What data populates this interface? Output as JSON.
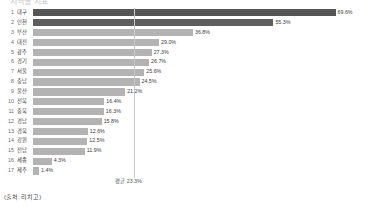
{
  "title": "지역별 지표",
  "source_note": "(출처: 리치고)",
  "average": {
    "label": "평균 23.3%",
    "value": 23.3
  },
  "chart_data": {
    "type": "bar",
    "orientation": "horizontal",
    "title": "지역별 지표",
    "xlabel": "",
    "ylabel": "",
    "xlim": [
      0,
      72
    ],
    "grid": false,
    "legend": "none",
    "average_line": 23.3,
    "average_label": "평균 23.3%",
    "source": "(출처: 리치고)",
    "unit": "%",
    "categories": [
      "대구",
      "인천",
      "부산",
      "대전",
      "광주",
      "경기",
      "서울",
      "충남",
      "울산",
      "전북",
      "충북",
      "경남",
      "경북",
      "강원",
      "전남",
      "세종",
      "제주"
    ],
    "ranks": [
      1,
      2,
      3,
      4,
      5,
      6,
      7,
      8,
      9,
      10,
      11,
      12,
      13,
      14,
      15,
      16,
      17
    ],
    "values": [
      69.6,
      55.3,
      36.8,
      29.0,
      27.3,
      26.7,
      25.6,
      24.5,
      21.2,
      16.4,
      16.3,
      15.8,
      12.6,
      12.5,
      11.9,
      4.3,
      1.4
    ],
    "value_labels": [
      "69.6%",
      "55.3%",
      "36.8%",
      "29.0%",
      "27.3%",
      "26.7%",
      "25.6%",
      "24.5%",
      "21.2%",
      "16.4%",
      "16.3%",
      "15.8%",
      "12.6%",
      "12.5%",
      "11.9%",
      "4.3%",
      "1.4%"
    ],
    "colors": {
      "bar_default": "#b3b3b3",
      "bar_highlight": "#555555",
      "bar_highlight_2": "#5e5e5e",
      "average_line": "#c9c9c9",
      "text": "#3c3c3c",
      "background": "#ffffff"
    },
    "highlight_ranks": [
      1,
      2
    ]
  }
}
